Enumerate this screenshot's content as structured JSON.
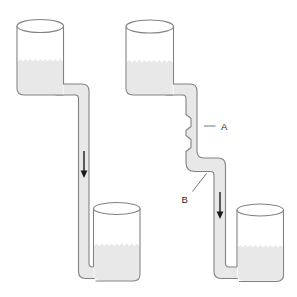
{
  "figure": {
    "labels": {
      "a": "A",
      "b": "B"
    },
    "flow_arrows": {
      "glyph": "↓",
      "direction": "down",
      "count": 2
    },
    "colors": {
      "background": "#ffffff",
      "liquid": "#e8e8e8",
      "outline": "#828282",
      "arrow": "#1a1a1a",
      "leader": "#757575"
    }
  }
}
